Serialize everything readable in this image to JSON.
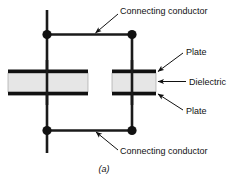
{
  "figure": {
    "caption": "(a)",
    "colors": {
      "wire": "#1a1a1a",
      "plate": "#111111",
      "dielectric_fill": "#e6e6e6",
      "dielectric_stroke": "#9a9a9a",
      "text": "#111111",
      "background": "#ffffff"
    },
    "labels": {
      "connecting_conductor_top": "Connecting conductor",
      "connecting_conductor_bottom": "Connecting conductor",
      "plate_top": "Plate",
      "dielectric": "Dielectric",
      "plate_bottom": "Plate"
    },
    "components": {
      "left_capacitor_name": "left-capacitor",
      "right_capacitor_name": "right-capacitor",
      "node_top_left": "junction-dot",
      "node_top_right": "junction-dot",
      "node_bottom_left": "junction-dot",
      "node_bottom_right": "junction-dot"
    }
  }
}
